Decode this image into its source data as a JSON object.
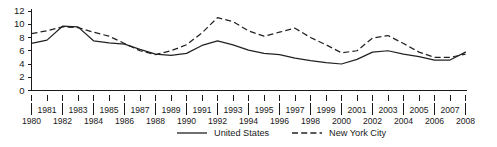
{
  "chart_data": {
    "type": "line",
    "title": "",
    "xlabel": "",
    "ylabel": "",
    "ylim": [
      0,
      12
    ],
    "xlim": [
      1980,
      2008
    ],
    "yticks": [
      0,
      2,
      4,
      6,
      8,
      10,
      12
    ],
    "grid": false,
    "legend_position": "bottom-center",
    "x": [
      1980,
      1981,
      1982,
      1983,
      1984,
      1985,
      1986,
      1987,
      1988,
      1989,
      1990,
      1991,
      1992,
      1993,
      1994,
      1995,
      1996,
      1997,
      1998,
      1999,
      2000,
      2001,
      2002,
      2003,
      2004,
      2005,
      2006,
      2007,
      2008
    ],
    "categories": [
      "1980",
      "1981",
      "1982",
      "1983",
      "1984",
      "1985",
      "1986",
      "1987",
      "1988",
      "1989",
      "1990",
      "1991",
      "1992",
      "1993",
      "1994",
      "1995",
      "1996",
      "1997",
      "1998",
      "1999",
      "2000",
      "2001",
      "2002",
      "2003",
      "2004",
      "2005",
      "2006",
      "2007",
      "2008"
    ],
    "xticks_upper": [
      "1981",
      "1983",
      "1985",
      "1987",
      "1989",
      "1991",
      "1993",
      "1995",
      "1997",
      "1999",
      "2001",
      "2003",
      "2005",
      "2007"
    ],
    "xticks_lower": [
      "1980",
      "1982",
      "1984",
      "1986",
      "1988",
      "1990",
      "1992",
      "1994",
      "1996",
      "1998",
      "2000",
      "2002",
      "2004",
      "2006",
      "2008"
    ],
    "series": [
      {
        "name": "United States",
        "style": "solid",
        "color": "#222222",
        "values": [
          7.1,
          7.6,
          9.7,
          9.6,
          7.5,
          7.2,
          7.0,
          6.2,
          5.5,
          5.3,
          5.6,
          6.8,
          7.5,
          6.9,
          6.1,
          5.6,
          5.4,
          4.9,
          4.5,
          4.2,
          4.0,
          4.7,
          5.8,
          6.0,
          5.5,
          5.1,
          4.6,
          4.6,
          5.8
        ]
      },
      {
        "name": "New York City",
        "style": "dashed",
        "color": "#222222",
        "values": [
          8.6,
          9.0,
          9.6,
          9.5,
          8.8,
          8.2,
          7.1,
          6.0,
          5.4,
          6.0,
          6.9,
          8.7,
          11.0,
          10.4,
          9.0,
          8.2,
          8.8,
          9.4,
          8.0,
          6.9,
          5.7,
          6.0,
          7.9,
          8.3,
          7.1,
          5.8,
          5.0,
          5.0,
          5.5
        ]
      }
    ],
    "legend": [
      {
        "label": "United States",
        "style": "solid"
      },
      {
        "label": "New York City",
        "style": "dashed"
      }
    ]
  }
}
